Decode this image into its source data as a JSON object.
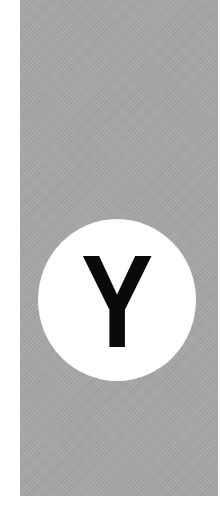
{
  "sign": {
    "letter": "Y",
    "colors": {
      "panel": "#a6a6a6",
      "circle": "#ffffff",
      "letter": "#0a0a0a",
      "background": "#ffffff"
    }
  }
}
